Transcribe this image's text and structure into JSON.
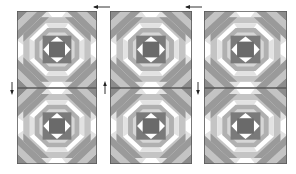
{
  "diagram": {
    "type": "quilt-layout",
    "pattern": "pineapple-block",
    "grid": {
      "columns": 3,
      "rows": 2
    },
    "colors": {
      "background": "#ffffff",
      "outline": "#5a5a5a",
      "dark": "#6e6e6e",
      "mid": "#9a9a9a",
      "light": "#c4c4c4",
      "pale": "#e2e2e2",
      "white": "#ffffff"
    },
    "blocks": [
      {
        "id": "r1c1",
        "row": 1,
        "col": 1,
        "x": 17,
        "y": 11,
        "w": 80,
        "h": 77
      },
      {
        "id": "r1c2",
        "row": 1,
        "col": 2,
        "x": 110,
        "y": 11,
        "w": 82,
        "h": 77
      },
      {
        "id": "r1c3",
        "row": 1,
        "col": 3,
        "x": 204,
        "y": 11,
        "w": 83,
        "h": 77
      },
      {
        "id": "r2c1",
        "row": 2,
        "col": 1,
        "x": 17,
        "y": 88,
        "w": 80,
        "h": 76
      },
      {
        "id": "r2c2",
        "row": 2,
        "col": 2,
        "x": 110,
        "y": 88,
        "w": 82,
        "h": 76
      },
      {
        "id": "r2c3",
        "row": 2,
        "col": 3,
        "x": 204,
        "y": 88,
        "w": 83,
        "h": 76
      }
    ],
    "arrows": [
      {
        "id": "press-left-1",
        "direction": "left",
        "x": 94,
        "y": 7
      },
      {
        "id": "press-left-2",
        "direction": "left",
        "x": 186,
        "y": 7
      },
      {
        "id": "press-down-1",
        "direction": "down",
        "x": 12,
        "y": 86
      },
      {
        "id": "press-up-2",
        "direction": "up",
        "x": 105,
        "y": 86
      },
      {
        "id": "press-down-3",
        "direction": "down",
        "x": 198,
        "y": 86
      }
    ]
  }
}
